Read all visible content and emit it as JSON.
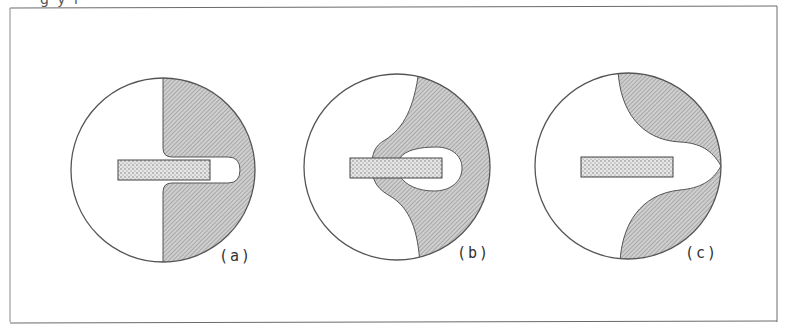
{
  "figure": {
    "top_fragment": "g y  i",
    "panels": [
      {
        "id": "a",
        "label": "(a)"
      },
      {
        "id": "b",
        "label": "(b)"
      },
      {
        "id": "c",
        "label": "(c)"
      }
    ],
    "colors": {
      "frame": "#6a6a6a",
      "outline": "#555555",
      "hatch_fill": "#c8c8c8",
      "hatch_line": "#8a8a8a",
      "stipple_fill": "#e4e4e4",
      "stipple_dot": "#6e6e6e"
    }
  }
}
